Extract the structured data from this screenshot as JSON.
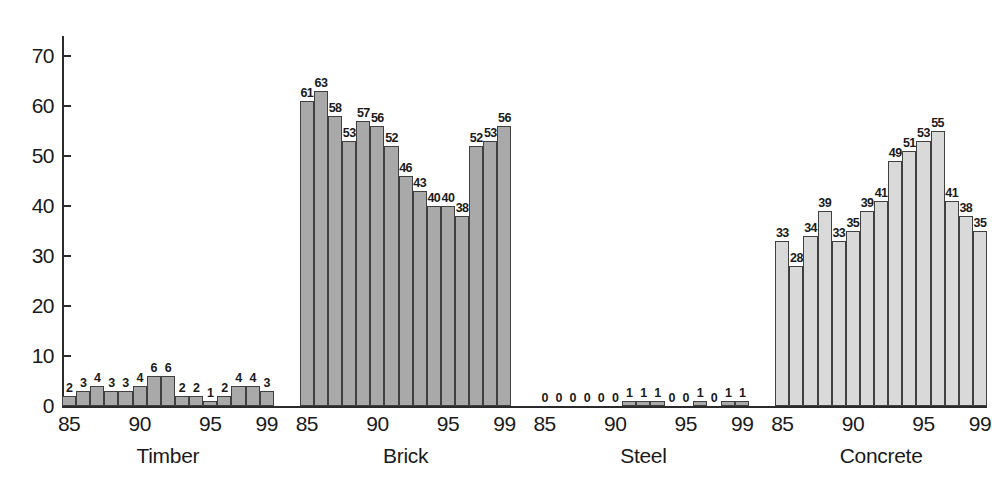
{
  "chart_data": {
    "type": "bar",
    "title": "",
    "subtitle": "",
    "xlabel": "",
    "ylabel": "",
    "ylim": [
      0,
      74
    ],
    "yticks": [
      0,
      10,
      20,
      30,
      40,
      50,
      60,
      70
    ],
    "ytick_labels": [
      "0",
      "10",
      "20",
      "30",
      "40",
      "50",
      "60",
      "70"
    ],
    "grid": false,
    "legend": "none",
    "x": [
      "85",
      "86",
      "87",
      "88",
      "89",
      "90",
      "91",
      "92",
      "93",
      "94",
      "95",
      "96",
      "97",
      "98",
      "99"
    ],
    "xtick_labels": [
      "85",
      "90",
      "95",
      "99"
    ],
    "xtick_indices": [
      0,
      5,
      10,
      14
    ],
    "value_labels_shown": true,
    "groups": [
      {
        "name": "Timber",
        "shade": "shade-dark",
        "color": "#a9a9a9",
        "categories": [
          "85",
          "86",
          "87",
          "88",
          "89",
          "90",
          "91",
          "92",
          "93",
          "94",
          "95",
          "96",
          "97",
          "98",
          "99"
        ],
        "values": [
          2,
          3,
          4,
          3,
          3,
          4,
          6,
          6,
          2,
          2,
          1,
          2,
          4,
          4,
          3
        ]
      },
      {
        "name": "Brick",
        "shade": "shade-dark",
        "color": "#a9a9a9",
        "categories": [
          "85",
          "86",
          "87",
          "88",
          "89",
          "90",
          "91",
          "92",
          "93",
          "94",
          "95",
          "96",
          "97",
          "98",
          "99"
        ],
        "values": [
          61,
          63,
          58,
          53,
          57,
          56,
          52,
          46,
          43,
          40,
          40,
          38,
          52,
          53,
          56
        ]
      },
      {
        "name": "Steel",
        "shade": "shade-dark",
        "color": "#a9a9a9",
        "categories": [
          "85",
          "86",
          "87",
          "88",
          "89",
          "90",
          "91",
          "92",
          "93",
          "94",
          "95",
          "96",
          "97",
          "98",
          "99"
        ],
        "values": [
          0,
          0,
          0,
          0,
          0,
          0,
          1,
          1,
          1,
          0,
          0,
          1,
          0,
          1,
          1
        ]
      },
      {
        "name": "Concrete",
        "shade": "shade-light",
        "color": "#d9d9d9",
        "categories": [
          "85",
          "86",
          "87",
          "88",
          "89",
          "90",
          "91",
          "92",
          "93",
          "94",
          "95",
          "96",
          "97",
          "98",
          "99"
        ],
        "values": [
          33,
          28,
          34,
          39,
          33,
          35,
          39,
          41,
          49,
          51,
          53,
          55,
          41,
          38,
          35
        ]
      }
    ]
  },
  "axis": {
    "color": "#2b2b2b"
  }
}
